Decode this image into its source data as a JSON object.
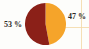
{
  "chart_data": {
    "type": "pie",
    "title": "",
    "categories": [
      "Segment A",
      "Segment B"
    ],
    "values": [
      47,
      53
    ],
    "labels": [
      "47 %",
      "53 %"
    ],
    "colors": [
      "#F5A42A",
      "#8B2018"
    ],
    "legend": "none",
    "grid": true,
    "units": "%",
    "total": 100,
    "start_angle_deg": 0,
    "slices": [
      {
        "name": "Segment A",
        "value": 47,
        "label": "47 %",
        "color": "#F5A42A",
        "position": "right"
      },
      {
        "name": "Segment B",
        "value": 53,
        "label": "53 %",
        "color": "#8B2018",
        "position": "left"
      }
    ]
  },
  "canvas": {
    "background_color": "#fdfdfb",
    "gridline_color": "#f3d9a8",
    "label_color": "#2e2a26"
  }
}
